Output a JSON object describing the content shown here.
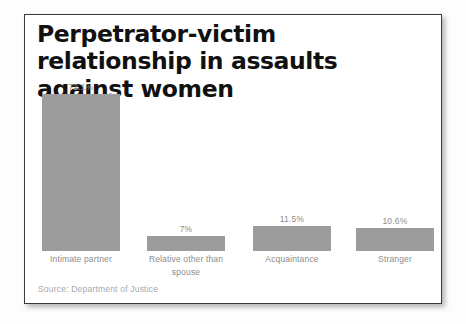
{
  "card": {
    "title": "Perpetrator-victim relationship in assaults against women",
    "source": "Source: Department of Justice"
  },
  "chart_data": {
    "type": "bar",
    "title": "Perpetrator-victim relationship in assaults against women",
    "subtitle": "",
    "xlabel": "",
    "ylabel": "",
    "categories": [
      "Intimate partner",
      "Relative other than spouse",
      "Acquaintance",
      "Stranger"
    ],
    "values": [
      72.1,
      7,
      11.5,
      10.6
    ],
    "value_labels": [
      "72.1%",
      "7%",
      "11.5%",
      "10.6%"
    ],
    "ylim": [
      0,
      72.1
    ],
    "grid": false,
    "legend": "none",
    "bar_color": "#9c9c9c",
    "annotations": [
      "Source: Department of Justice"
    ]
  },
  "style": {
    "bar_color": "#9c9c9c",
    "label_color": "#8d8d8d",
    "title_color": "#111111",
    "source_color": "#a8a8a8",
    "card_border": "#3a3a3a"
  }
}
